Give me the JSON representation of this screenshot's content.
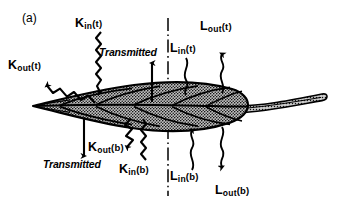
{
  "figure": {
    "panel_label": "(a)",
    "midline": "dash-dot vertical symmetry line",
    "texture": "stippled shaded leaf blade with vein lines and tapered petiole"
  },
  "labels": {
    "k_out_t": {
      "base": "K",
      "sub": "out",
      "arg": "(t)"
    },
    "k_in_t": {
      "base": "K",
      "sub": "in",
      "arg": "(t)"
    },
    "k_out_b": {
      "base": "K",
      "sub": "out",
      "arg": "(b)"
    },
    "k_in_b": {
      "base": "K",
      "sub": "in",
      "arg": "(b)"
    },
    "l_in_t": {
      "base": "L",
      "sub": "in",
      "arg": "(t)"
    },
    "l_out_t": {
      "base": "L",
      "sub": "out",
      "arg": "(t)"
    },
    "l_in_b": {
      "base": "L",
      "sub": "in",
      "arg": "(b)"
    },
    "l_out_b": {
      "base": "L",
      "sub": "out",
      "arg": "(b)"
    },
    "transmitted_top": "Transmitted",
    "transmitted_bottom": "Transmitted"
  },
  "colors": {
    "ink": "#000000",
    "background": "#ffffff",
    "blade_fill": "#b9b9b9",
    "petiole_fill": "#c9c9c9"
  }
}
